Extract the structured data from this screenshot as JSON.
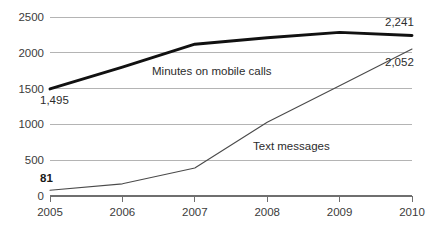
{
  "chart_data": {
    "type": "line",
    "title": "",
    "subtitle": "",
    "xlabel": "",
    "ylabel": "",
    "categories": [
      "2005",
      "2006",
      "2007",
      "2008",
      "2009",
      "2010"
    ],
    "x": [
      2005,
      2006,
      2007,
      2008,
      2009,
      2010
    ],
    "xlim": [
      2005,
      2010
    ],
    "ylim": [
      0,
      2500
    ],
    "y_ticks": [
      0,
      500,
      1000,
      1500,
      2000,
      2500
    ],
    "y_tick_labels": [
      "0",
      "500",
      "1000",
      "1500",
      "2000",
      "2500"
    ],
    "grid": "horizontal",
    "legend_position": "inline-annotation",
    "series": [
      {
        "name": "Minutes on mobile calls",
        "style": "thick-black",
        "values": [
          1495,
          1800,
          2120,
          2210,
          2285,
          2241
        ],
        "labels": {
          "start": "1,495",
          "end": "2,241"
        }
      },
      {
        "name": "Text messages",
        "style": "thin-gray",
        "values": [
          81,
          170,
          390,
          1030,
          1540,
          2052
        ],
        "labels": {
          "start": "81",
          "end": "2,052"
        }
      }
    ],
    "annotations": [
      {
        "text": "Minutes on mobile calls",
        "series": "Minutes on mobile calls"
      },
      {
        "text": "Text messages",
        "series": "Text messages"
      },
      {
        "text": "1,495",
        "series": "Minutes on mobile calls",
        "role": "start-value"
      },
      {
        "text": "2,241",
        "series": "Minutes on mobile calls",
        "role": "end-value"
      },
      {
        "text": "81",
        "series": "Text messages",
        "role": "start-value"
      },
      {
        "text": "2,052",
        "series": "Text messages",
        "role": "end-value"
      }
    ],
    "colors": {
      "series_minutes": "#111111",
      "series_texts": "#4a4a4a",
      "gridline": "#b4b4b4",
      "axis": "#6f6f6f",
      "text": "#3b3b3b",
      "background": "#ffffff"
    }
  }
}
